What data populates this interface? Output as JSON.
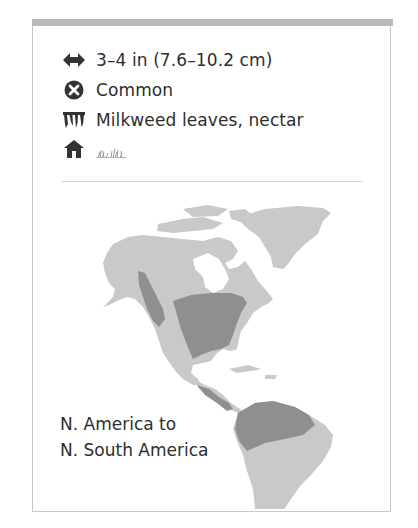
{
  "card": {
    "facts": [
      {
        "icon": "wingspan-arrows-icon",
        "text": "3–4 in (7.6–10.2 cm)"
      },
      {
        "icon": "status-common-icon",
        "text": "Common"
      },
      {
        "icon": "food-icon",
        "text": "Milkweed leaves, nectar"
      },
      {
        "icon": "habitat-house-icon",
        "text": "",
        "habitat_icon": "grassland-icon"
      }
    ],
    "range": {
      "line1": "N. America to",
      "line2": "N. South America"
    },
    "map": {
      "land_color": "#c9c9c9",
      "range_color": "#8f8f8f"
    }
  }
}
